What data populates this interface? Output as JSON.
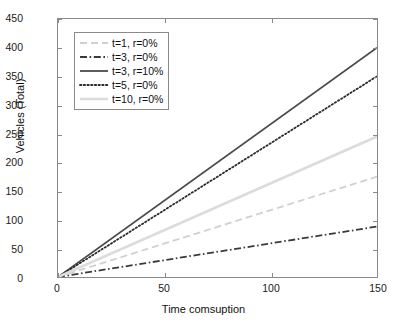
{
  "chart_data": {
    "type": "line",
    "title": "",
    "xlabel": "Time comsuption",
    "ylabel": "Vehicles (Total)",
    "xlim": [
      0,
      150
    ],
    "ylim": [
      0,
      450
    ],
    "xticks": [
      0,
      50,
      100,
      150
    ],
    "yticks": [
      0,
      50,
      100,
      150,
      200,
      250,
      300,
      350,
      400,
      450
    ],
    "grid": false,
    "legend_position": "upper left (inside axes)",
    "x": [
      0,
      150
    ],
    "series": [
      {
        "name": "t=1, r=0%",
        "values": [
          0,
          175
        ],
        "style": "dashed",
        "color": "#d0d0d0",
        "width": 1.8
      },
      {
        "name": "t=3, r=0%",
        "values": [
          0,
          88
        ],
        "style": "dash-dot",
        "color": "#3a3a3a",
        "width": 1.8
      },
      {
        "name": "t=3, r=10%",
        "values": [
          0,
          400
        ],
        "style": "solid",
        "color": "#4a4a4a",
        "width": 1.8
      },
      {
        "name": "t=5, r=0%",
        "values": [
          0,
          350
        ],
        "style": "dotted",
        "color": "#2a2a2a",
        "width": 1.8
      },
      {
        "name": "t=10, r=0%",
        "values": [
          0,
          245
        ],
        "style": "solid",
        "color": "#dcdcdc",
        "width": 2.6
      }
    ]
  },
  "axes": {
    "y_tick_labels": [
      "0",
      "50",
      "100",
      "150",
      "200",
      "250",
      "300",
      "350",
      "400",
      "450"
    ],
    "x_tick_labels": [
      "0",
      "50",
      "100",
      "150"
    ],
    "x_title": "Time comsuption",
    "y_title": "Vehicles (Total)"
  },
  "legend": {
    "entries": [
      {
        "label": "t=1, r=0%"
      },
      {
        "label": "t=3, r=0%"
      },
      {
        "label": "t=3, r=10%"
      },
      {
        "label": "t=5, r=0%"
      },
      {
        "label": "t=10, r=0%"
      }
    ]
  },
  "colors": {
    "frame": "#8a8a8a",
    "text": "#111111",
    "background": "#ffffff"
  }
}
